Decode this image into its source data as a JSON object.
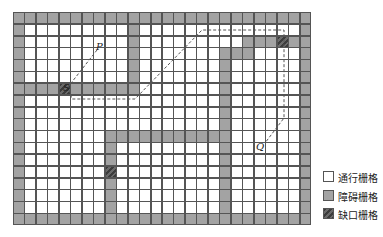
{
  "grid": {
    "cols": 26,
    "rows": 18,
    "cell_w": 11.46,
    "cell_h": 11.83,
    "origin": [
      13,
      12
    ],
    "obstacles": {
      "border": true,
      "segments": [
        {
          "desc": "col 10 wall",
          "cells": [
            [
              1,
              10
            ],
            [
              2,
              10
            ],
            [
              3,
              10
            ],
            [
              4,
              10
            ],
            [
              5,
              10
            ],
            [
              6,
              10
            ]
          ]
        },
        {
          "desc": "row 6 wall",
          "cells": [
            [
              6,
              1
            ],
            [
              6,
              2
            ],
            [
              6,
              3
            ],
            [
              6,
              5
            ],
            [
              6,
              6
            ],
            [
              6,
              7
            ],
            [
              6,
              8
            ],
            [
              6,
              9
            ]
          ]
        },
        {
          "desc": "row 2 wall",
          "cells": [
            [
              2,
              20
            ],
            [
              2,
              21
            ],
            [
              2,
              22
            ],
            [
              2,
              24
            ]
          ]
        },
        {
          "desc": "row 3 wall",
          "cells": [
            [
              3,
              19
            ],
            [
              3,
              20
            ]
          ]
        },
        {
          "desc": "col 18 wall",
          "cells": [
            [
              3,
              18
            ],
            [
              4,
              18
            ],
            [
              5,
              18
            ],
            [
              6,
              18
            ],
            [
              7,
              18
            ],
            [
              8,
              18
            ],
            [
              9,
              18
            ],
            [
              10,
              18
            ],
            [
              11,
              18
            ],
            [
              12,
              18
            ],
            [
              13,
              18
            ],
            [
              14,
              18
            ],
            [
              15,
              18
            ],
            [
              16,
              18
            ]
          ]
        },
        {
          "desc": "row 10 wall",
          "cells": [
            [
              10,
              8
            ],
            [
              10,
              9
            ],
            [
              10,
              10
            ],
            [
              10,
              11
            ],
            [
              10,
              12
            ],
            [
              10,
              13
            ],
            [
              10,
              14
            ],
            [
              10,
              15
            ],
            [
              10,
              16
            ],
            [
              10,
              17
            ]
          ]
        },
        {
          "desc": "col 8 wall",
          "cells": [
            [
              11,
              8
            ],
            [
              12,
              8
            ],
            [
              14,
              8
            ],
            [
              15,
              8
            ],
            [
              16,
              8
            ]
          ]
        }
      ]
    },
    "gaps": [
      [
        6,
        4
      ],
      [
        2,
        23
      ],
      [
        13,
        8
      ]
    ]
  },
  "path": {
    "points": [
      [
        97,
        50
      ],
      [
        68,
        87
      ],
      [
        72,
        99
      ],
      [
        135,
        99
      ],
      [
        202,
        30
      ],
      [
        284,
        30
      ],
      [
        284,
        118
      ],
      [
        265,
        143
      ]
    ],
    "color": "#555555"
  },
  "labels": {
    "P": {
      "text": "P",
      "x": 96,
      "y": 41
    },
    "S": {
      "text": "S",
      "x": 63,
      "y": 82
    },
    "Q": {
      "text": "Q",
      "x": 256,
      "y": 141
    }
  },
  "legend": {
    "items": [
      {
        "label": "通行栅格",
        "type": "free"
      },
      {
        "label": "障碍栅格",
        "type": "obstacle"
      },
      {
        "label": "缺口栅格",
        "type": "gap"
      }
    ]
  },
  "colors": {
    "free": "#ffffff",
    "obstacle": "#a3a3a3",
    "gap": "#3c3c3c",
    "grid_line": "#555555"
  }
}
